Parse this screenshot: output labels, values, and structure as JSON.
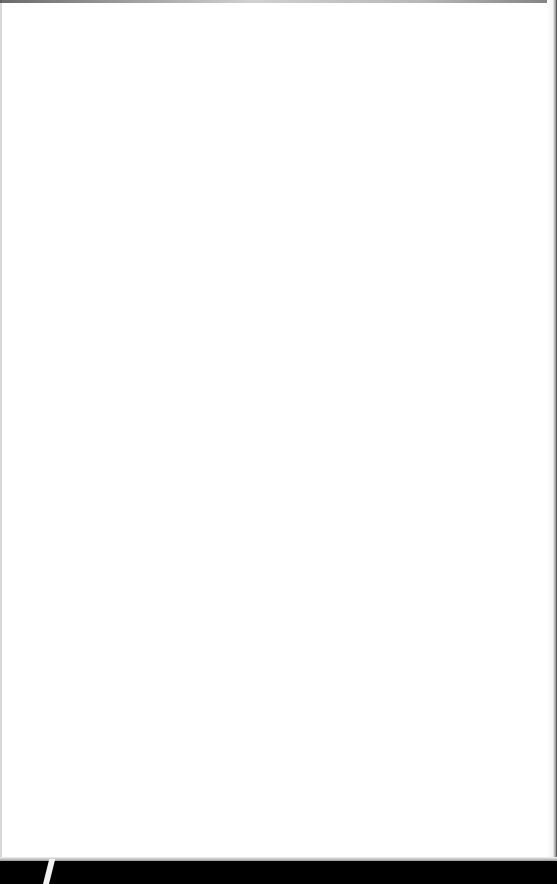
{
  "document": {
    "type": "blank-page",
    "content": []
  },
  "colors": {
    "page": "#ffffff",
    "background": "#000000",
    "mark": "#f2f2f2"
  }
}
